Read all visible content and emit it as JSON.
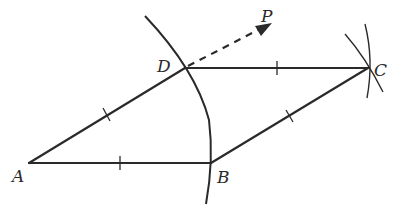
{
  "diagram": {
    "type": "geometric-construction",
    "points": {
      "A": {
        "label": "A",
        "x": 29,
        "y": 163
      },
      "B": {
        "label": "B",
        "x": 211,
        "y": 163
      },
      "C": {
        "label": "C",
        "x": 368,
        "y": 68
      },
      "D": {
        "label": "D",
        "x": 185,
        "y": 68
      },
      "P": {
        "label": "P",
        "x": 270,
        "y": 24
      }
    },
    "segments": [
      {
        "from": "A",
        "to": "B",
        "tick_marks": 1
      },
      {
        "from": "A",
        "to": "D",
        "tick_marks": 1
      },
      {
        "from": "D",
        "to": "C",
        "tick_marks": 1
      },
      {
        "from": "B",
        "to": "C",
        "tick_marks": 1
      }
    ],
    "ray": {
      "from": "D",
      "toward": "P",
      "style": "dashed",
      "arrow": true
    },
    "arcs": [
      {
        "name": "arc-centered-A",
        "through": [
          "D",
          "B"
        ]
      },
      {
        "name": "arc-centered-D-at-C"
      },
      {
        "name": "arc-centered-B-at-C"
      }
    ],
    "colors": {
      "ink": "#2a2a2a",
      "background": "#ffffff"
    }
  }
}
